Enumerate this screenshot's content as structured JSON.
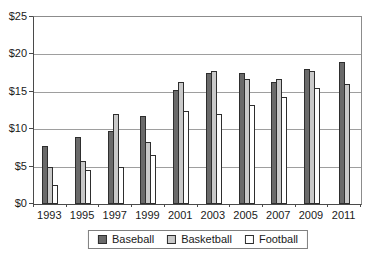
{
  "chart_data": {
    "type": "bar",
    "title": "",
    "xlabel": "",
    "ylabel": "",
    "categories": [
      "1993",
      "1995",
      "1997",
      "1999",
      "2001",
      "2003",
      "2005",
      "2007",
      "2009",
      "2011"
    ],
    "series": [
      {
        "name": "Baseball",
        "color": "#6a6a6a",
        "values": [
          7.75,
          9.0,
          9.75,
          11.75,
          15.25,
          17.5,
          17.5,
          16.25,
          18.0,
          19.0
        ]
      },
      {
        "name": "Basketball",
        "color": "#c9c9c9",
        "values": [
          5.0,
          5.75,
          12.0,
          8.25,
          16.25,
          17.75,
          16.75,
          16.75,
          17.75,
          16.0
        ]
      },
      {
        "name": "Football",
        "color": "#ffffff",
        "values": [
          2.5,
          4.5,
          5.0,
          6.5,
          12.5,
          12.0,
          13.25,
          14.25,
          15.5,
          null
        ]
      }
    ],
    "ylim": [
      0,
      25
    ],
    "ytick_step": 5,
    "ytick_labels": [
      "$0",
      "$5",
      "$10",
      "$15",
      "$20",
      "$25"
    ],
    "grid": true,
    "legend_position": "bottom",
    "legend_labels": [
      "Baseball",
      "Basketball",
      "Football"
    ]
  },
  "colors": {
    "axis": "#4a4a4a",
    "grid": "#9e9e9e",
    "bar_border": "#2e2e2e",
    "frame": "#8c8c8c",
    "text": "#1a1a1a",
    "background": "#ffffff"
  }
}
